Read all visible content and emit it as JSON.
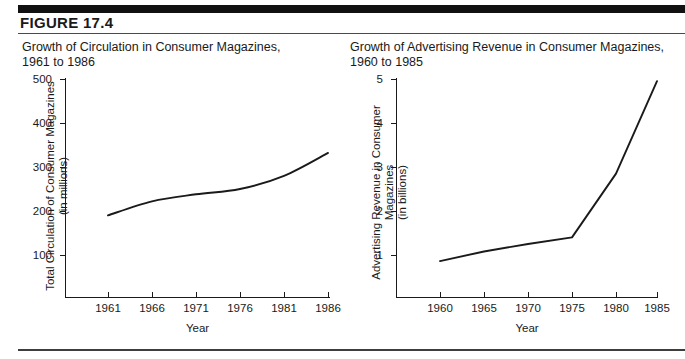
{
  "figure": {
    "label": "FIGURE  17.4"
  },
  "panels": [
    {
      "id": "left",
      "title": "Growth of Circulation in Consumer Magazines,\n1961 to 1986"
    },
    {
      "id": "right",
      "title": "Growth of Advertising Revenue in Consumer Magazines,\n1960 to 1985"
    }
  ],
  "chart_data": [
    {
      "type": "line",
      "title": "Growth of Circulation in Consumer Magazines, 1961 to 1986",
      "xlabel": "Year",
      "ylabel": "Total Circulation of Consumer Magazines\n(in millions)",
      "ylabel_line1": "Total Circulation of Consumer Magazines",
      "ylabel_line2": "(in millions)",
      "x": [
        1961,
        1966,
        1971,
        1976,
        1981,
        1986
      ],
      "values": [
        190,
        222,
        238,
        250,
        280,
        332
      ],
      "xticks": [
        "1961",
        "1966",
        "1971",
        "1976",
        "1981",
        "1986"
      ],
      "yticks": [
        "100",
        "200",
        "300",
        "400",
        "500"
      ],
      "ytick_values": [
        100,
        200,
        300,
        400,
        500
      ],
      "xlim": [
        1959.5,
        1987.5
      ],
      "ylim": [
        0,
        500
      ],
      "grid": false,
      "legend": "none",
      "line_color": "#1a1a1a"
    },
    {
      "type": "line",
      "title": "Growth of Advertising Revenue in Consumer Magazines, 1960 to 1985",
      "xlabel": "Year",
      "ylabel": "Advertising Revenue in Consumer Magazines\n(in billions)",
      "ylabel_line1": "Advertising Revenue in Consumer Magazines",
      "ylabel_line2": "(in billions)",
      "x": [
        1960,
        1965,
        1970,
        1975,
        1980,
        1985
      ],
      "values": [
        0.86,
        1.08,
        1.25,
        1.4,
        2.85,
        4.95
      ],
      "xticks": [
        "1960",
        "1965",
        "1970",
        "1975",
        "1980",
        "1985"
      ],
      "yticks": [
        "1",
        "2",
        "3",
        "4",
        "5"
      ],
      "ytick_values": [
        1,
        2,
        3,
        4,
        5
      ],
      "xlim": [
        1958.5,
        1986.5
      ],
      "ylim": [
        0,
        5
      ],
      "grid": false,
      "legend": "none",
      "line_color": "#1a1a1a"
    }
  ]
}
